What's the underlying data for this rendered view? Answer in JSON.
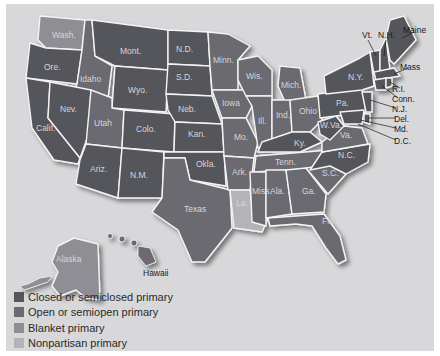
{
  "map": {
    "colors": {
      "closed": "#55555b",
      "open": "#6a6a70",
      "blanket": "#8e8e94",
      "nonpartisan": "#b4b4b8",
      "background": "#d8d8da"
    },
    "state_labels": {
      "wash": "Wash.",
      "ore": "Ore.",
      "calif": "Calif.",
      "idaho": "Idaho",
      "nev": "Nev.",
      "mont": "Mont.",
      "wyo": "Wyo.",
      "utah": "Utah",
      "ariz": "Ariz.",
      "colo": "Colo.",
      "nm": "N.M.",
      "nd": "N.D.",
      "sd": "S.D.",
      "neb": "Neb.",
      "kan": "Kan.",
      "okla": "Okla.",
      "texas": "Texas",
      "minn": "Minn.",
      "iowa": "Iowa",
      "mo": "Mo.",
      "ark": "Ark.",
      "la": "La.",
      "wis": "Wis.",
      "ill": "Ill.",
      "mich": "Mich.",
      "ind": "Ind.",
      "ohio": "Ohio",
      "ky": "Ky.",
      "tenn": "Tenn.",
      "miss": "Miss.",
      "ala": "Ala.",
      "ga": "Ga.",
      "fla": "Fla.",
      "sc": "S.C.",
      "nc": "N.C.",
      "va": "Va.",
      "wva": "W.Va.",
      "pa": "Pa.",
      "ny": "N.Y.",
      "vt": "Vt.",
      "nh": "N.H.",
      "maine": "Maine",
      "mass": "Mass",
      "ri": "R.I.",
      "conn": "Conn.",
      "nj": "N.J.",
      "del": "Del.",
      "md": "Md.",
      "dc": "D.C.",
      "alaska": "Alaska",
      "hawaii": "Hawaii"
    }
  },
  "legend": {
    "items": [
      {
        "label": "Closed or semiclosed primary",
        "color": "#55555b"
      },
      {
        "label": "Open or semiopen primary",
        "color": "#6a6a70"
      },
      {
        "label": "Blanket primary",
        "color": "#8e8e94"
      },
      {
        "label": "Nonpartisan primary",
        "color": "#b4b4b8"
      }
    ]
  }
}
